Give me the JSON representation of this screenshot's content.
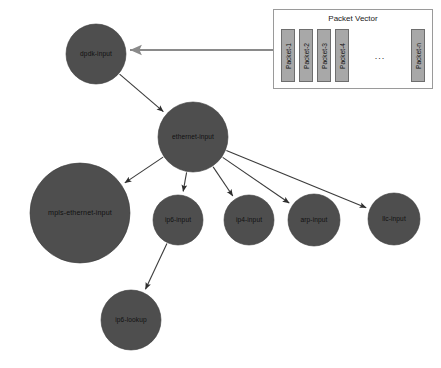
{
  "diagram": {
    "background_color": "#ffffff",
    "node_color": "#4e4e4e",
    "edge_color": "#3b3b3b",
    "feed_arrow_color": "#8a8a8a",
    "nodes": [
      {
        "id": "dpdk-input",
        "label": "dpdk-input",
        "cx": 96,
        "cy": 54,
        "r": 30
      },
      {
        "id": "ethernet-input",
        "label": "ethernet-input",
        "cx": 193,
        "cy": 137,
        "r": 35
      },
      {
        "id": "mpls-ethernet-input",
        "label": "mpls-ethernet-input",
        "cx": 80,
        "cy": 213,
        "r": 50
      },
      {
        "id": "ip6-input",
        "label": "ip6-input",
        "cx": 178,
        "cy": 220,
        "r": 25
      },
      {
        "id": "ip4-input",
        "label": "ip4-input",
        "cx": 249,
        "cy": 220,
        "r": 25
      },
      {
        "id": "arp-input",
        "label": "arp-input",
        "cx": 314,
        "cy": 220,
        "r": 26
      },
      {
        "id": "llc-input",
        "label": "llc-input",
        "cx": 394,
        "cy": 219,
        "r": 26
      },
      {
        "id": "ip6-lookup",
        "label": "ip6-lookup",
        "cx": 131,
        "cy": 320,
        "r": 30
      }
    ],
    "edges": [
      {
        "from": "dpdk-input",
        "to": "ethernet-input",
        "arrow": true
      },
      {
        "from": "ethernet-input",
        "to": "mpls-ethernet-input",
        "arrow": true
      },
      {
        "from": "ethernet-input",
        "to": "ip6-input",
        "arrow": true
      },
      {
        "from": "ethernet-input",
        "to": "ip4-input",
        "arrow": true
      },
      {
        "from": "ethernet-input",
        "to": "arp-input",
        "arrow": true
      },
      {
        "from": "ethernet-input",
        "to": "llc-input",
        "arrow": true
      },
      {
        "from": "ip6-input",
        "to": "ip6-lookup",
        "arrow": true
      }
    ],
    "feed_arrow": {
      "label": "packet-vector-to-dpdk-input",
      "from_x": 273,
      "to_x": 130,
      "y": 50
    }
  },
  "packet_vector": {
    "title": "Packet Vector",
    "ellipsis": "...",
    "packets": [
      {
        "label": "Packet-1"
      },
      {
        "label": "Packet-2"
      },
      {
        "label": "Packet-3"
      },
      {
        "label": "Packet-4"
      }
    ],
    "last_packet": {
      "label": "Packet-n"
    }
  }
}
